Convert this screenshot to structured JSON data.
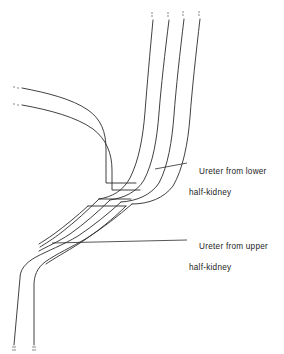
{
  "figure": {
    "type": "anatomical-line-diagram",
    "width": 284,
    "height": 354,
    "background_color": "#ffffff",
    "line_color": "#2b2b2b",
    "text_color": "#1c1c1c"
  },
  "labels": [
    {
      "id": "lower",
      "line1": "Ureter from lower",
      "line2": "half-kidney",
      "text_x": 189,
      "text_y": 157,
      "leader_x1": 155,
      "leader_y1": 169,
      "leader_x2": 187,
      "leader_y2": 163
    },
    {
      "id": "upper",
      "line1": "Ureter from upper",
      "line2": "half-kidney",
      "text_x": 189,
      "text_y": 232,
      "leader_x1": 52,
      "leader_y1": 243,
      "leader_x2": 187,
      "leader_y2": 240
    }
  ],
  "structures": {
    "lower_ureter_top_strands": 4,
    "upper_ureter_left_strands": 2,
    "descending_strands": 2,
    "break_mark_ends": [
      "top-strand-1",
      "top-strand-2",
      "top-strand-3",
      "top-strand-4",
      "left-strand-1",
      "left-strand-2",
      "bottom-strand-1",
      "bottom-strand-2"
    ]
  }
}
